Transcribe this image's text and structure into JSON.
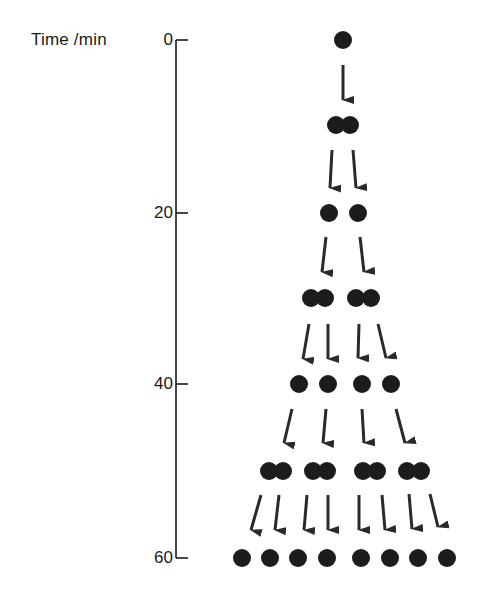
{
  "figure": {
    "axis_title": "Time /min",
    "axis": {
      "x": 176,
      "y_top": 40,
      "y_bottom": 558,
      "tick_length": 12,
      "ticks": [
        {
          "label": "0",
          "value": 0,
          "y": 40
        },
        {
          "label": "20",
          "value": 20,
          "y": 213
        },
        {
          "label": "40",
          "value": 40,
          "y": 384
        },
        {
          "label": "60",
          "value": 60,
          "y": 558
        }
      ]
    },
    "colors": {
      "cell": "#1c1c1c",
      "arrow": "#2a2a2a",
      "axis": "#1a1a1a",
      "background": "#ffffff"
    },
    "cell_radius": 9,
    "generations": [
      {
        "time_min": 0,
        "y": 40,
        "state": "single",
        "cells_x": [
          343
        ]
      },
      {
        "time_min": 10,
        "y": 125,
        "state": "dividing",
        "cells_x": [
          336,
          350
        ]
      },
      {
        "time_min": 20,
        "y": 213,
        "state": "single",
        "cells_x": [
          329,
          358
        ]
      },
      {
        "time_min": 30,
        "y": 298,
        "state": "dividing",
        "cells_x": [
          311,
          325,
          356,
          371
        ]
      },
      {
        "time_min": 40,
        "y": 384,
        "state": "single",
        "cells_x": [
          299,
          328,
          362,
          391
        ]
      },
      {
        "time_min": 50,
        "y": 471,
        "state": "dividing",
        "cells_x": [
          269,
          283,
          313,
          327,
          363,
          377,
          407,
          421
        ]
      },
      {
        "time_min": 60,
        "y": 558,
        "state": "single",
        "cells_x": [
          242,
          270,
          298,
          327,
          361,
          390,
          418,
          447
        ]
      }
    ],
    "arrows": [
      {
        "x1": 343,
        "y1": 65,
        "x2": 343,
        "y2": 100
      },
      {
        "x1": 332,
        "y1": 150,
        "x2": 330,
        "y2": 188
      },
      {
        "x1": 353,
        "y1": 150,
        "x2": 356,
        "y2": 188
      },
      {
        "x1": 326,
        "y1": 237,
        "x2": 322,
        "y2": 272
      },
      {
        "x1": 360,
        "y1": 237,
        "x2": 364,
        "y2": 272
      },
      {
        "x1": 309,
        "y1": 324,
        "x2": 303,
        "y2": 359
      },
      {
        "x1": 328,
        "y1": 324,
        "x2": 328,
        "y2": 359
      },
      {
        "x1": 359,
        "y1": 324,
        "x2": 358,
        "y2": 358
      },
      {
        "x1": 378,
        "y1": 324,
        "x2": 386,
        "y2": 358
      },
      {
        "x1": 292,
        "y1": 409,
        "x2": 284,
        "y2": 443
      },
      {
        "x1": 326,
        "y1": 409,
        "x2": 323,
        "y2": 443
      },
      {
        "x1": 362,
        "y1": 409,
        "x2": 364,
        "y2": 443
      },
      {
        "x1": 396,
        "y1": 409,
        "x2": 405,
        "y2": 443
      },
      {
        "x1": 261,
        "y1": 495,
        "x2": 251,
        "y2": 530
      },
      {
        "x1": 279,
        "y1": 495,
        "x2": 275,
        "y2": 530
      },
      {
        "x1": 307,
        "y1": 495,
        "x2": 304,
        "y2": 530
      },
      {
        "x1": 328,
        "y1": 495,
        "x2": 328,
        "y2": 530
      },
      {
        "x1": 359,
        "y1": 495,
        "x2": 359,
        "y2": 530
      },
      {
        "x1": 382,
        "y1": 495,
        "x2": 385,
        "y2": 530
      },
      {
        "x1": 409,
        "y1": 494,
        "x2": 412,
        "y2": 529
      },
      {
        "x1": 430,
        "y1": 494,
        "x2": 438,
        "y2": 527
      }
    ]
  }
}
